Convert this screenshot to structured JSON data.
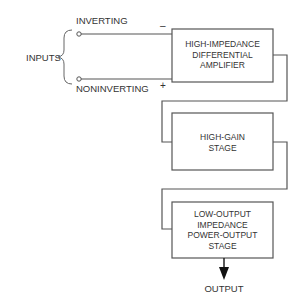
{
  "diagram": {
    "inputs_label": "INPUTS",
    "inverting_label": "INVERTING",
    "noninverting_label": "NONINVERTING",
    "minus_sign": "–",
    "plus_sign": "+",
    "stages": [
      {
        "lines": [
          "HIGH-IMPEDANCE",
          "DIFFERENTIAL",
          "AMPLIFIER"
        ]
      },
      {
        "lines": [
          "HIGH-GAIN",
          "STAGE"
        ]
      },
      {
        "lines": [
          "LOW-OUTPUT",
          "IMPEDANCE",
          "POWER-OUTPUT",
          "STAGE"
        ]
      }
    ],
    "output_label": "OUTPUT",
    "colors": {
      "line": "#555555",
      "text": "#333333",
      "shadow": "#bbbbbb"
    }
  }
}
